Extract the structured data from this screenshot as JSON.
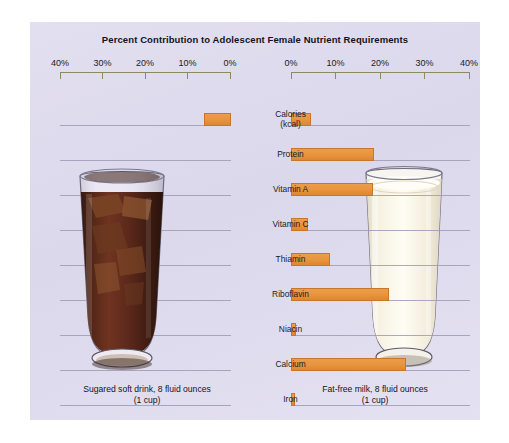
{
  "figure": {
    "title": "Percent Contribution to Adolescent Female Nutrient Requirements",
    "panel_color": "#dfdcee",
    "bar_color": "#e8943c",
    "gridline_color": "#9d9ab4",
    "axis_color": "#8d8a62"
  },
  "captions": {
    "left_line1": "Sugared soft drink, 8 fluid ounces",
    "left_line2": "(1 cup)",
    "right_line1": "Fat-free milk, 8 fluid ounces",
    "right_line2": "(1 cup)"
  },
  "axis": {
    "left_ticks": [
      "40%",
      "30%",
      "20%",
      "10%",
      "0%"
    ],
    "right_ticks": [
      "0%",
      "10%",
      "20%",
      "30%",
      "40%"
    ]
  },
  "chart_data": {
    "type": "bar",
    "orientation": "horizontal",
    "layout": "diverging-paired",
    "title": "Percent Contribution to Adolescent Female Nutrient Requirements",
    "xlabel": "",
    "ylabel": "",
    "xlim": [
      0,
      40
    ],
    "xticks": [
      0,
      10,
      20,
      30,
      40
    ],
    "grid": true,
    "legend": "none",
    "categories": [
      "Calories (kcal)",
      "Protein",
      "Vitamin A",
      "Vitamin C",
      "Thiamin",
      "Riboflavin",
      "Niacin",
      "Calcium",
      "Iron"
    ],
    "series": [
      {
        "name": "Sugared soft drink, 8 fluid ounces (1 cup)",
        "direction": "left",
        "values": [
          6.3,
          0,
          0,
          0,
          0,
          0,
          0,
          0,
          0
        ]
      },
      {
        "name": "Fat-free milk, 8 fluid ounces (1 cup)",
        "direction": "right",
        "values": [
          4.5,
          18.6,
          18.4,
          3.8,
          8.8,
          21.8,
          1.2,
          25.6,
          1.0
        ]
      }
    ]
  },
  "images": {
    "left": "cola-glass-with-ice",
    "right": "glass-of-milk"
  }
}
